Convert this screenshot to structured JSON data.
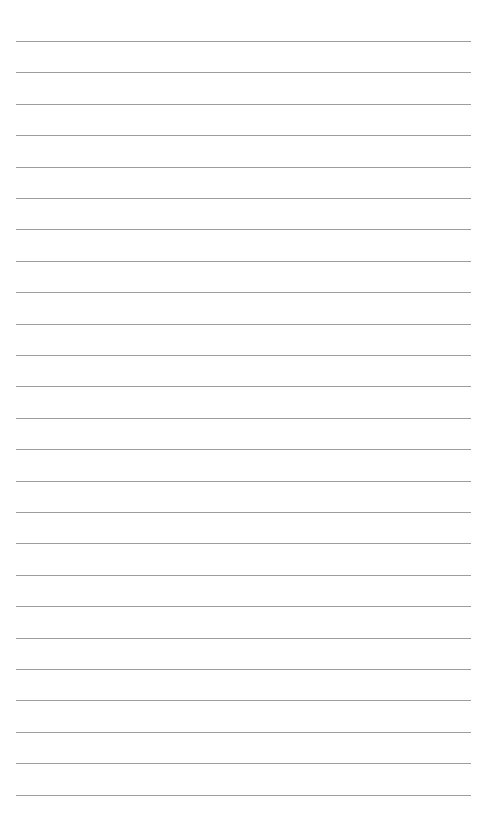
{
  "page": {
    "type": "lined-paper",
    "background_color": "#ffffff",
    "line_color": "#8c8c8c",
    "line_count": 25,
    "first_line_y": 41,
    "line_spacing": 31.4,
    "line_left": 16,
    "line_right": 471
  }
}
